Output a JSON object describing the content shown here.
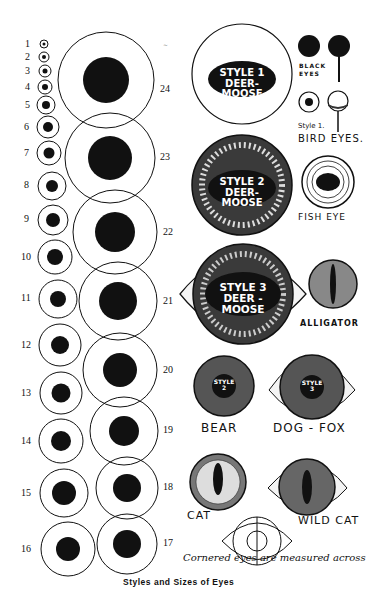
{
  "title": "Styles and Sizes of Eyes",
  "note": "Cornered eyes are measured across",
  "sizes": [
    {
      "n": "1",
      "cx": 44,
      "cy": 44,
      "r": 4,
      "p": 1.5,
      "lx": 25,
      "ly": 39
    },
    {
      "n": "2",
      "cx": 44,
      "cy": 57,
      "r": 5,
      "p": 2,
      "lx": 25,
      "ly": 52
    },
    {
      "n": "3",
      "cx": 45,
      "cy": 71,
      "r": 6,
      "p": 2.5,
      "lx": 25,
      "ly": 66
    },
    {
      "n": "4",
      "cx": 45,
      "cy": 87,
      "r": 7,
      "p": 3,
      "lx": 25,
      "ly": 82
    },
    {
      "n": "5",
      "cx": 46,
      "cy": 105,
      "r": 9,
      "p": 4,
      "lx": 25,
      "ly": 100
    },
    {
      "n": "6",
      "cx": 48,
      "cy": 127,
      "r": 11,
      "p": 5,
      "lx": 24,
      "ly": 122
    },
    {
      "n": "7",
      "cx": 49,
      "cy": 153,
      "r": 12,
      "p": 5.5,
      "lx": 24,
      "ly": 148
    },
    {
      "n": "8",
      "cx": 52,
      "cy": 186,
      "r": 14,
      "p": 6,
      "lx": 24,
      "ly": 180
    },
    {
      "n": "9",
      "cx": 53,
      "cy": 220,
      "r": 15,
      "p": 7,
      "lx": 24,
      "ly": 214
    },
    {
      "n": "10",
      "cx": 55,
      "cy": 257,
      "r": 17,
      "p": 8,
      "lx": 21,
      "ly": 252
    },
    {
      "n": "11",
      "cx": 58,
      "cy": 299,
      "r": 19,
      "p": 8,
      "lx": 21,
      "ly": 293
    },
    {
      "n": "12",
      "cx": 60,
      "cy": 345,
      "r": 21,
      "p": 9,
      "lx": 21,
      "ly": 340
    },
    {
      "n": "13",
      "cx": 61,
      "cy": 393,
      "r": 21,
      "p": 9.5,
      "lx": 21,
      "ly": 388
    },
    {
      "n": "14",
      "cx": 61,
      "cy": 441,
      "r": 22,
      "p": 10,
      "lx": 21,
      "ly": 436
    },
    {
      "n": "15",
      "cx": 64,
      "cy": 493,
      "r": 24,
      "p": 12,
      "lx": 21,
      "ly": 488
    },
    {
      "n": "16",
      "cx": 68,
      "cy": 549,
      "r": 27,
      "p": 12,
      "lx": 21,
      "ly": 544
    },
    {
      "n": "17",
      "cx": 127,
      "cy": 544,
      "r": 30,
      "p": 14,
      "lx": 163,
      "ly": 538
    },
    {
      "n": "18",
      "cx": 127,
      "cy": 488,
      "r": 31,
      "p": 14,
      "lx": 163,
      "ly": 482
    },
    {
      "n": "19",
      "cx": 124,
      "cy": 431,
      "r": 34,
      "p": 15,
      "lx": 163,
      "ly": 425
    },
    {
      "n": "20",
      "cx": 120,
      "cy": 370,
      "r": 37,
      "p": 17,
      "lx": 163,
      "ly": 365
    },
    {
      "n": "21",
      "cx": 118,
      "cy": 301,
      "r": 39,
      "p": 19,
      "lx": 163,
      "ly": 296
    },
    {
      "n": "22",
      "cx": 115,
      "cy": 232,
      "r": 42,
      "p": 20,
      "lx": 163,
      "ly": 227
    },
    {
      "n": "23",
      "cx": 110,
      "cy": 158,
      "r": 45,
      "p": 22,
      "lx": 160,
      "ly": 152
    },
    {
      "n": "24",
      "cx": 106,
      "cy": 80,
      "r": 48,
      "p": 23,
      "lx": 160,
      "ly": 84
    }
  ],
  "styles": {
    "style1": {
      "line1": "STYLE 1",
      "line2": "DEER-MOOSE"
    },
    "style2": {
      "line1": "STYLE 2",
      "line2": "DEER-MOOSE"
    },
    "style3": {
      "line1": "STYLE 3",
      "line2": "DEER - MOOSE"
    },
    "bear_badge": {
      "line1": "STYLE",
      "line2": "2"
    },
    "dogfox_badge": {
      "line1": "STYLE",
      "line2": "3"
    }
  },
  "labels": {
    "black_eyes": "BLACK EYES",
    "style1_small": "Style 1.",
    "bird_eyes": "BIRD EYES.",
    "fish_eye": "FISH EYE",
    "alligator": "ALLIGATOR",
    "bear": "BEAR",
    "dog_fox": "DOG - FOX",
    "cat": "CAT",
    "wild_cat": "WILD CAT"
  },
  "colors": {
    "ink": "#111111",
    "paper": "#ffffff",
    "iris": "#555555"
  }
}
